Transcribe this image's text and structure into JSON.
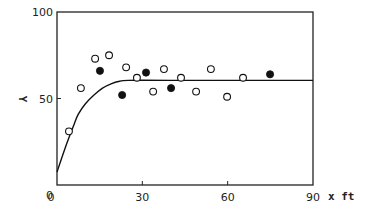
{
  "chart_data": {
    "type": "scatter",
    "title": "",
    "xlabel": "x ft",
    "ylabel": "Y",
    "xlim": [
      0,
      90
    ],
    "ylim": [
      0,
      100
    ],
    "x_ticks": [
      0,
      30,
      60,
      90
    ],
    "y_ticks": [
      0,
      50,
      100
    ],
    "x_tick_labels": [
      "0",
      "30",
      "60",
      "90"
    ],
    "y_tick_labels": [
      "0",
      "50",
      "100"
    ],
    "grid": false,
    "legend": null,
    "series": [
      {
        "name": "open circles",
        "marker": "open-circle",
        "points": [
          [
            4.2,
            31
          ],
          [
            8.4,
            56
          ],
          [
            13.4,
            73
          ],
          [
            18.3,
            75
          ],
          [
            24.3,
            68
          ],
          [
            28.1,
            62
          ],
          [
            33.8,
            54
          ],
          [
            37.6,
            67
          ],
          [
            43.6,
            62
          ],
          [
            48.9,
            54
          ],
          [
            54.1,
            67
          ],
          [
            59.8,
            51
          ],
          [
            65.4,
            62
          ]
        ]
      },
      {
        "name": "filled circles",
        "marker": "filled-circle",
        "points": [
          [
            15.1,
            66
          ],
          [
            22.9,
            52
          ],
          [
            31.3,
            65
          ],
          [
            40.1,
            56
          ],
          [
            74.9,
            64
          ]
        ]
      },
      {
        "name": "fitted curve",
        "type": "line",
        "points": [
          [
            0,
            7.5
          ],
          [
            3,
            22
          ],
          [
            6,
            35
          ],
          [
            7.5,
            41
          ],
          [
            10,
            47
          ],
          [
            13,
            52
          ],
          [
            16,
            56
          ],
          [
            19,
            58.5
          ],
          [
            22,
            60
          ],
          [
            25,
            60.5
          ],
          [
            40,
            60.5
          ],
          [
            90,
            60.5
          ]
        ]
      }
    ]
  }
}
